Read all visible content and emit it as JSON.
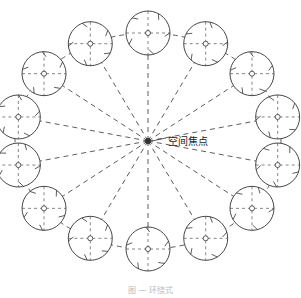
{
  "diagram": {
    "focus_label": "空间焦点",
    "caption": "图 — 环绕式",
    "center": [
      148,
      141
    ],
    "orbit": {
      "rx": 133,
      "ry": 108
    },
    "tree_count": 14,
    "tree_radius": 22,
    "line_color": "#333333"
  }
}
